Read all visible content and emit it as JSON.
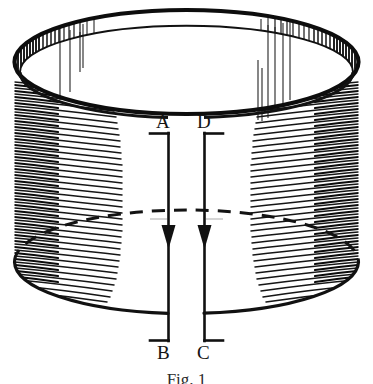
{
  "figure": {
    "caption": "Fig. 1",
    "background_color": "#ffffff",
    "ink_color": "#111111",
    "labels": [
      {
        "id": "A",
        "text": "A",
        "position": "top-left-of-slit"
      },
      {
        "id": "D",
        "text": "D",
        "position": "top-right-of-slit"
      },
      {
        "id": "B",
        "text": "B",
        "position": "bottom-left-of-slit"
      },
      {
        "id": "C",
        "text": "C",
        "position": "bottom-right-of-slit"
      }
    ],
    "elements": {
      "top_rim_label": "top ellipse rim",
      "bottom_rim_label": "bottom ellipse rim",
      "hidden_rim_label": "hidden bottom rim (dashed)",
      "slit_left_label": "slit edge A-B",
      "slit_right_label": "slit edge D-C",
      "arrow_left_label": "downward arrow on A-B",
      "arrow_right_label": "downward arrow on D-C",
      "shading_left_label": "left curved hatching",
      "shading_right_label": "right curved hatching",
      "shading_inner_label": "inner rim vertical hatching"
    }
  },
  "geometry": {
    "cx": 186.5,
    "top_cy": 62,
    "bottom_cy": 262,
    "rx": 172,
    "ry": 52,
    "slit_left_x": 168,
    "slit_right_x": 204,
    "slit_top_y": 133,
    "slit_bottom_y": 341,
    "arrow_tip_y": 248,
    "rim_thickness": 11
  }
}
